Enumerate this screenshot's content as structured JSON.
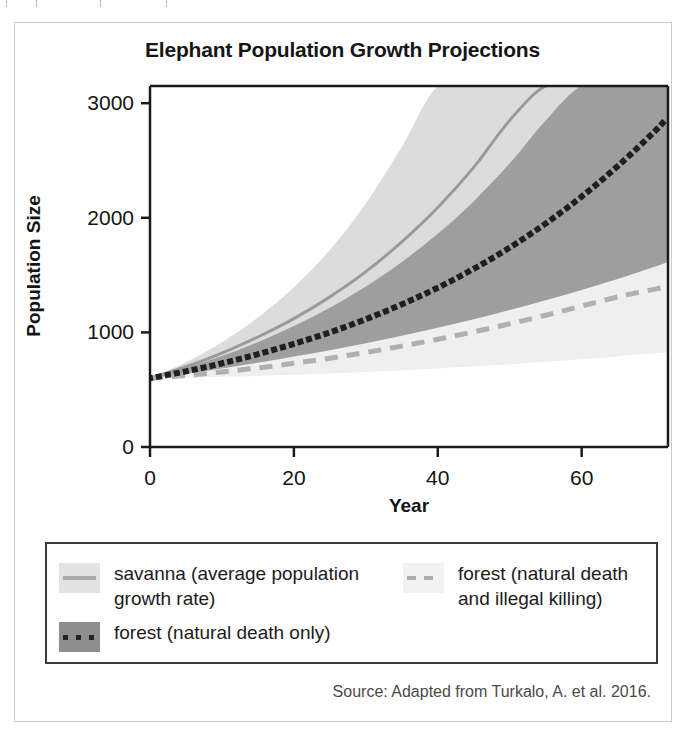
{
  "figure": {
    "title": "Elephant Population Growth Projections",
    "source": "Source: Adapted from Turkalo, A. et al. 2016."
  },
  "chart_data": {
    "type": "line",
    "title": "Elephant Population Growth Projections",
    "xlabel": "Year",
    "ylabel": "Population Size",
    "xlim": [
      0,
      72
    ],
    "ylim": [
      0,
      3150
    ],
    "xticks": [
      0,
      20,
      40,
      60
    ],
    "yticks": [
      0,
      1000,
      2000,
      3000
    ],
    "grid": false,
    "legend_position": "below-plot",
    "x": [
      0,
      5,
      10,
      15,
      20,
      25,
      30,
      35,
      40,
      45,
      50,
      55,
      60,
      65,
      70,
      72
    ],
    "series": [
      {
        "name": "savanna (average population growth rate)",
        "style": "solid",
        "color": "#9a9a9a",
        "band_color": "#dcdcdc",
        "values": [
          600,
          700,
          820,
          960,
          1120,
          1310,
          1530,
          1790,
          2090,
          2440,
          2850,
          3150,
          3150,
          3150,
          3150,
          3150
        ],
        "band_low": [
          600,
          665,
          740,
          825,
          915,
          1020,
          1135,
          1265,
          1410,
          1570,
          1750,
          1950,
          2170,
          2420,
          2700,
          2820
        ],
        "band_high": [
          600,
          740,
          915,
          1130,
          1395,
          1720,
          2125,
          2620,
          3150,
          3150,
          3150,
          3150,
          3150,
          3150,
          3150,
          3150
        ]
      },
      {
        "name": "forest (natural death only)",
        "style": "dotted",
        "color": "#1f1f1f",
        "band_color": "#9e9e9e",
        "values": [
          600,
          660,
          730,
          810,
          900,
          1000,
          1115,
          1245,
          1390,
          1555,
          1740,
          1950,
          2185,
          2450,
          2745,
          2880
        ],
        "band_low": [
          600,
          640,
          685,
          735,
          790,
          845,
          905,
          970,
          1040,
          1115,
          1195,
          1280,
          1370,
          1465,
          1570,
          1615
        ],
        "band_high": [
          600,
          690,
          795,
          915,
          1055,
          1215,
          1400,
          1615,
          1860,
          2145,
          2475,
          2850,
          3150,
          3150,
          3150,
          3150
        ]
      },
      {
        "name": "forest (natural death and illegal killing)",
        "style": "dashed",
        "color": "#b0b0b0",
        "band_color": "#efefef",
        "values": [
          600,
          625,
          655,
          690,
          730,
          775,
          825,
          880,
          940,
          1005,
          1075,
          1150,
          1230,
          1310,
          1375,
          1400
        ],
        "band_low": [
          600,
          605,
          612,
          620,
          630,
          642,
          655,
          670,
          686,
          704,
          723,
          744,
          766,
          790,
          815,
          826
        ],
        "band_high": [
          600,
          650,
          706,
          770,
          842,
          922,
          1012,
          1112,
          1222,
          1344,
          1478,
          1625,
          1786,
          1962,
          2152,
          2232
        ]
      }
    ]
  },
  "legend": {
    "entries": [
      {
        "label": "savanna (average population growth rate)",
        "swatch_fill": "#e2e2e2",
        "line_color": "#a8a8a8",
        "line_style": "solid"
      },
      {
        "label": "forest (natural death and illegal killing)",
        "swatch_fill": "#f2f2f2",
        "line_color": "#adadad",
        "line_style": "dashed"
      },
      {
        "label": "forest (natural death only)",
        "swatch_fill": "#8e8e8e",
        "line_color": "#232323",
        "line_style": "dotted"
      }
    ]
  },
  "colors": {
    "axis": "#1a1a1a",
    "frame": "#c9c9c9",
    "legend_border": "#3a3a3a",
    "text": "#161616"
  }
}
